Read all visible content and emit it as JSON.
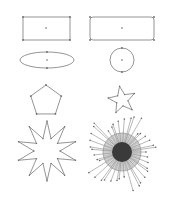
{
  "canvas": {
    "width": 176,
    "height": 204,
    "background": "#ffffff",
    "stroke": "#7a7a7a"
  },
  "shapes": [
    {
      "id": "rectangle",
      "type": "rect",
      "x": 23,
      "y": 17,
      "w": 47,
      "h": 23,
      "rx": 0,
      "center": [
        46,
        28
      ]
    },
    {
      "id": "rounded-rectangle",
      "type": "rect",
      "x": 90,
      "y": 17,
      "w": 64,
      "h": 23,
      "rx": 3,
      "center": [
        122,
        28
      ]
    },
    {
      "id": "ellipse",
      "type": "ellipse",
      "cx": 47,
      "cy": 60,
      "rx": 27,
      "ry": 8
    },
    {
      "id": "circle",
      "type": "circle",
      "cx": 122,
      "cy": 60,
      "r": 12
    },
    {
      "id": "pentagon",
      "type": "polygon",
      "cx": 46,
      "cy": 101,
      "r": 16,
      "points": 5,
      "rotation": -90
    },
    {
      "id": "five-point-star",
      "type": "star",
      "cx": 122,
      "cy": 100,
      "outer": 14,
      "inner": 6,
      "points": 5,
      "rotation": -100
    },
    {
      "id": "ten-point-star",
      "type": "star",
      "cx": 47,
      "cy": 151,
      "outer": 30,
      "inner": 13,
      "points": 10,
      "rotation": -90
    },
    {
      "id": "starburst",
      "type": "burst",
      "cx": 122,
      "cy": 152,
      "core_r": 10,
      "halo_r": 19,
      "spoke_count": 40,
      "spoke_min": 24,
      "spoke_max": 40
    }
  ]
}
